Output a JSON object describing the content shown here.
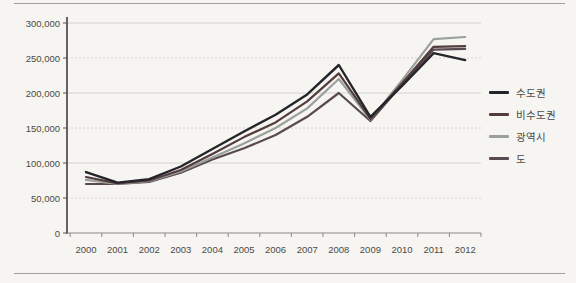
{
  "page": {
    "background": "#f6f5f2",
    "rule_color": "#a19f9a"
  },
  "chart_data": {
    "type": "line",
    "title": "",
    "xlabel": "",
    "ylabel": "",
    "categories": [
      "2000",
      "2001",
      "2002",
      "2003",
      "2004",
      "2005",
      "2006",
      "2007",
      "2008",
      "2009",
      "2010",
      "2011",
      "2012"
    ],
    "series": [
      {
        "id": "capital-region",
        "name": "수도권",
        "color": "#24252b",
        "width": 2.4,
        "values": [
          87000,
          72000,
          77000,
          95000,
          120000,
          145000,
          169000,
          198000,
          240000,
          166000,
          210000,
          257000,
          247000
        ]
      },
      {
        "id": "non-capital-region",
        "name": "비수도권",
        "color": "#533c3c",
        "width": 2.2,
        "values": [
          80000,
          71000,
          75000,
          90000,
          113000,
          137000,
          158000,
          188000,
          228000,
          163000,
          214000,
          266000,
          267000
        ]
      },
      {
        "id": "metropolitan-city",
        "name": "광역시",
        "color": "#9aa09a",
        "width": 2.2,
        "values": [
          76000,
          70000,
          74000,
          88000,
          108000,
          128000,
          150000,
          178000,
          220000,
          162000,
          218000,
          277000,
          280000
        ]
      },
      {
        "id": "province",
        "name": "도",
        "color": "#594951",
        "width": 2.2,
        "values": [
          70000,
          70000,
          73000,
          86000,
          105000,
          121000,
          140000,
          166000,
          200000,
          160000,
          212000,
          262000,
          263000
        ]
      }
    ],
    "ylim": [
      0,
      300000
    ],
    "ytick_step": 50000,
    "ytick_labels": [
      "0",
      "50,000",
      "100,000",
      "150,000",
      "200,000",
      "250,000",
      "300,000"
    ],
    "grid": true,
    "legend_position": "right",
    "axis_color": "#55544f",
    "grid_color": "#d3d2ce",
    "tick_label_color": "#4b4a46"
  }
}
